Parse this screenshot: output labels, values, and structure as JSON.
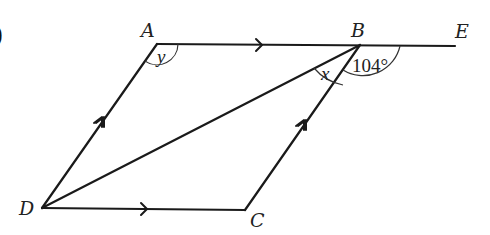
{
  "figure": {
    "question_marker": ")",
    "points": {
      "A": {
        "label": "A",
        "x": 157,
        "y": 44
      },
      "B": {
        "label": "B",
        "x": 360,
        "y": 45
      },
      "C": {
        "label": "C",
        "x": 245,
        "y": 210
      },
      "D": {
        "label": "D",
        "x": 42,
        "y": 208
      },
      "E": {
        "label": "E",
        "x": 455,
        "y": 46
      }
    },
    "segments": [
      "AB",
      "BE",
      "AD",
      "BC",
      "DC",
      "DB"
    ],
    "parallel_marks": {
      "single_arrow": [
        "AB",
        "DC"
      ],
      "double_arrow": [
        "DA",
        "CB"
      ]
    },
    "angles": {
      "y": {
        "label": "y",
        "at": "A",
        "description": "angle DAB"
      },
      "x": {
        "label": "x",
        "at": "B",
        "description": "angle DBC"
      },
      "CBE": {
        "label": "104°",
        "at": "B",
        "description": "angle CBE"
      }
    }
  }
}
